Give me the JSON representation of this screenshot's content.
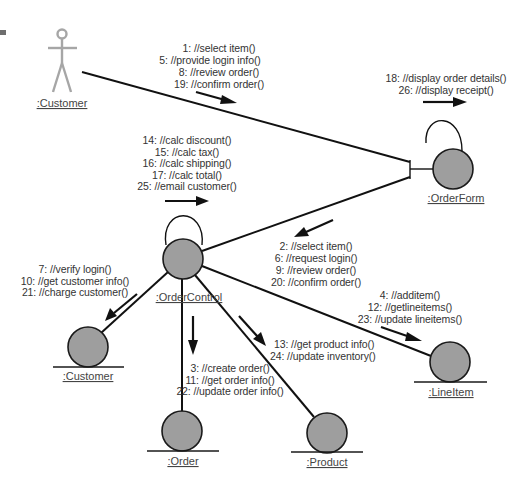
{
  "diagram": {
    "type": "UML collaboration diagram",
    "objects": {
      "actor_customer": {
        "label": ":Customer",
        "kind": "actor"
      },
      "order_form": {
        "label": ":OrderForm",
        "kind": "boundary"
      },
      "order_control": {
        "label": ":OrderControl",
        "kind": "control"
      },
      "customer": {
        "label": ":Customer",
        "kind": "entity"
      },
      "order": {
        "label": ":Order",
        "kind": "entity"
      },
      "product": {
        "label": ":Product",
        "kind": "entity"
      },
      "line_item": {
        "label": ":LineItem",
        "kind": "entity"
      }
    },
    "messages": {
      "actor_to_orderform": [
        "1: //select item()",
        "5: //provide login info()",
        "8: //review order()",
        "19: //confirm order()"
      ],
      "orderform_self": [
        "18: //display order details()",
        "26: //display receipt()"
      ],
      "ordercontrol_self": [
        "14: //calc discount()",
        "15: //calc tax()",
        "16: //calc shipping()",
        "17: //calc total()",
        "25: //email customer()"
      ],
      "orderform_to_ordercontrol": [
        "2: //select item()",
        "6: //request login()",
        "9: //review order()",
        "20: //confirm order()"
      ],
      "ordercontrol_to_customer": [
        "7: //verify login()",
        "10: //get customer info()",
        "21: //charge customer()"
      ],
      "ordercontrol_to_lineitem": [
        "4: //additem()",
        "12: //getlineitems()",
        "23: //update lineitems()"
      ],
      "ordercontrol_to_product": [
        "13: //get product info()",
        "24: //update inventory()"
      ],
      "ordercontrol_to_order": [
        "3: //create order()",
        "11: //get order info()",
        "22: //update order info()"
      ]
    },
    "colors": {
      "object_fill": "#9e9e9e",
      "actor_stroke": "#a6a6a6",
      "line": "#111111",
      "text": "#333333"
    }
  }
}
